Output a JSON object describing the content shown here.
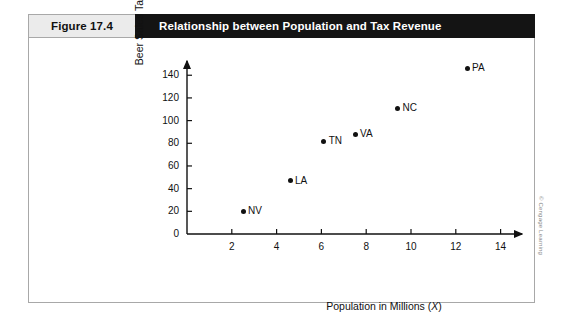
{
  "figure": {
    "number_label": "Figure 17.4",
    "title": "Relationship between Population and Tax Revenue",
    "credit": "© Cengage Learning"
  },
  "chart_data": {
    "type": "scatter",
    "title": "Relationship between Population and Tax Revenue",
    "xlabel": "Population in Millions (X)",
    "ylabel": "Beer Sales Tax Revenue (Y)",
    "xlim": [
      0,
      15
    ],
    "ylim": [
      0,
      150
    ],
    "xticks": [
      2,
      4,
      6,
      8,
      10,
      12,
      14
    ],
    "yticks": [
      0,
      20,
      40,
      60,
      80,
      100,
      120,
      140
    ],
    "grid": false,
    "legend": "none",
    "points": [
      {
        "label": "NV",
        "x": 2.5,
        "y": 20
      },
      {
        "label": "LA",
        "x": 4.6,
        "y": 47
      },
      {
        "label": "TN",
        "x": 6.1,
        "y": 82
      },
      {
        "label": "VA",
        "x": 7.5,
        "y": 88
      },
      {
        "label": "NC",
        "x": 9.4,
        "y": 111
      },
      {
        "label": "PA",
        "x": 12.5,
        "y": 146
      }
    ]
  },
  "colors": {
    "header_bar": "#141414",
    "number_chip": "#ebebeb",
    "frame_border": "#a8a8a8",
    "axis": "#111111",
    "point": "#111111"
  }
}
